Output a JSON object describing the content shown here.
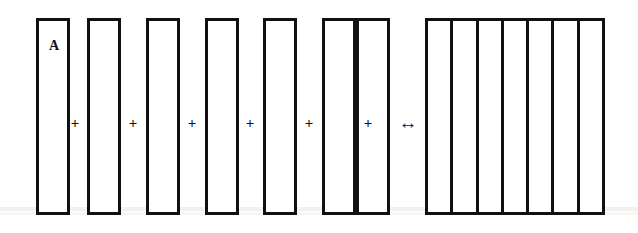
{
  "figure": {
    "background_color": "#ffffff",
    "stroke_color": "#111111",
    "canvas": {
      "width": 638,
      "height": 233
    }
  },
  "labels": {
    "first_bar": "A"
  },
  "operators": {
    "plus": "+",
    "double_arrow": "↔"
  },
  "left_bars": [
    {
      "id": "bar-1",
      "label": "A",
      "x": 36,
      "y": 18,
      "width": 34,
      "height": 197
    },
    {
      "id": "bar-2",
      "label": "",
      "x": 87,
      "y": 18,
      "width": 34,
      "height": 197
    },
    {
      "id": "bar-3",
      "label": "",
      "x": 146,
      "y": 18,
      "width": 34,
      "height": 197
    },
    {
      "id": "bar-4",
      "label": "",
      "x": 205,
      "y": 18,
      "width": 34,
      "height": 197
    },
    {
      "id": "bar-5",
      "label": "",
      "x": 263,
      "y": 18,
      "width": 34,
      "height": 197
    },
    {
      "id": "bar-6",
      "label": "",
      "x": 322,
      "y": 18,
      "width": 34,
      "height": 197
    },
    {
      "id": "bar-7",
      "label": "",
      "x": 356,
      "y": 18,
      "width": 34,
      "height": 197
    }
  ],
  "plus_positions": [
    {
      "id": "plus-1",
      "x": 62,
      "y": 116
    },
    {
      "id": "plus-2",
      "x": 120,
      "y": 116
    },
    {
      "id": "plus-3",
      "x": 179,
      "y": 116
    },
    {
      "id": "plus-4",
      "x": 237,
      "y": 116
    },
    {
      "id": "plus-5",
      "x": 296,
      "y": 116
    },
    {
      "id": "plus-6",
      "x": 355,
      "y": 116
    }
  ],
  "arrow": {
    "id": "arrow-1",
    "x": 395,
    "y": 113
  },
  "right_block": {
    "id": "block-1",
    "x": 425,
    "y": 18,
    "width": 180,
    "height": 197,
    "cell_count": 7,
    "cells": [
      {
        "id": "block-cell-1",
        "label": ""
      },
      {
        "id": "block-cell-2",
        "label": ""
      },
      {
        "id": "block-cell-3",
        "label": ""
      },
      {
        "id": "block-cell-4",
        "label": ""
      },
      {
        "id": "block-cell-5",
        "label": ""
      },
      {
        "id": "block-cell-6",
        "label": ""
      },
      {
        "id": "block-cell-7",
        "label": ""
      }
    ]
  }
}
